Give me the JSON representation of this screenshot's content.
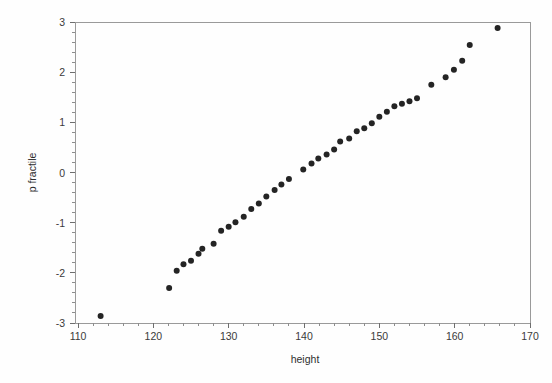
{
  "chart_data": {
    "type": "scatter",
    "title": "",
    "subtitle": "",
    "xlabel": "height",
    "ylabel": "p fractile",
    "xlim": [
      110,
      170
    ],
    "ylim": [
      -3,
      3
    ],
    "grid": false,
    "legend": null,
    "x_ticks": [
      110,
      120,
      130,
      140,
      150,
      160,
      170
    ],
    "x_tick_labels": [
      "110",
      "120",
      "130",
      "140",
      "150",
      "160",
      "170"
    ],
    "y_ticks": [
      -3,
      -2,
      -1,
      0,
      1,
      2,
      3
    ],
    "y_tick_labels": [
      "-3",
      "-2",
      "-1",
      "0",
      "1",
      "2",
      "3"
    ],
    "x_minor_step": 2,
    "y_minor_step": 0.2,
    "marker": "filled-circle",
    "marker_color": "#242424",
    "marker_size": 3,
    "series": [
      {
        "name": "normal probability plot",
        "points": [
          [
            113.0,
            -2.86
          ],
          [
            122.1,
            -2.3
          ],
          [
            123.1,
            -1.96
          ],
          [
            124.0,
            -1.83
          ],
          [
            125.0,
            -1.76
          ],
          [
            126.0,
            -1.62
          ],
          [
            126.5,
            -1.52
          ],
          [
            128.0,
            -1.42
          ],
          [
            129.0,
            -1.16
          ],
          [
            130.0,
            -1.08
          ],
          [
            130.9,
            -0.99
          ],
          [
            132.0,
            -0.88
          ],
          [
            133.0,
            -0.73
          ],
          [
            134.0,
            -0.62
          ],
          [
            135.0,
            -0.48
          ],
          [
            136.1,
            -0.35
          ],
          [
            137.0,
            -0.24
          ],
          [
            138.0,
            -0.13
          ],
          [
            139.9,
            0.06
          ],
          [
            141.0,
            0.18
          ],
          [
            141.9,
            0.28
          ],
          [
            143.0,
            0.36
          ],
          [
            144.0,
            0.46
          ],
          [
            144.8,
            0.62
          ],
          [
            146.0,
            0.68
          ],
          [
            147.0,
            0.82
          ],
          [
            148.0,
            0.88
          ],
          [
            149.0,
            0.98
          ],
          [
            150.0,
            1.11
          ],
          [
            151.0,
            1.21
          ],
          [
            152.0,
            1.32
          ],
          [
            153.0,
            1.37
          ],
          [
            154.0,
            1.42
          ],
          [
            155.0,
            1.48
          ],
          [
            156.9,
            1.75
          ],
          [
            158.8,
            1.9
          ],
          [
            159.9,
            2.05
          ],
          [
            161.0,
            2.23
          ],
          [
            162.0,
            2.54
          ],
          [
            165.7,
            2.88
          ]
        ]
      }
    ]
  },
  "axes": {
    "x_axis_name": "height-axis",
    "y_axis_name": "p-fractile-axis"
  }
}
